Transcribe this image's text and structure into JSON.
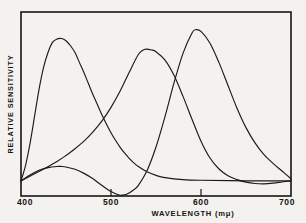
{
  "figure": {
    "background_color": "#f4f2ee",
    "ink_color": "#141414",
    "frame": {
      "left": 21,
      "top": 12,
      "right": 291,
      "bottom": 196
    }
  },
  "axis": {
    "x_title": "WAVELENGTH  (mμ)",
    "y_title": "RELATIVE  SENSITIVITY",
    "x_tick_labels": [
      "400",
      "500",
      "600",
      "700"
    ],
    "x_tick_values": [
      400,
      500,
      600,
      700
    ],
    "x_minor_ticks_drawn_at": [
      500,
      600
    ]
  },
  "chart_data": {
    "type": "line",
    "title": "",
    "subtitle": "",
    "xlabel": "WAVELENGTH  (mμ)",
    "ylabel": "RELATIVE  SENSITIVITY",
    "xlim": [
      400,
      700
    ],
    "ylim": [
      -0.09,
      1.0
    ],
    "grid": false,
    "legend": "none",
    "x_tick_labels": [
      "400",
      "500",
      "600",
      "700"
    ],
    "y_tick_labels": [],
    "annotations": [],
    "series": [
      {
        "name": "blue-receptor",
        "peak_wavelength": 445,
        "peak_value": 0.84,
        "x": [
          400,
          405,
          410,
          415,
          420,
          425,
          430,
          435,
          440,
          445,
          450,
          455,
          460,
          465,
          470,
          475,
          480,
          485,
          490,
          495,
          500,
          505,
          510,
          515,
          520,
          525,
          530,
          540,
          550,
          560,
          580,
          600,
          650,
          700
        ],
        "values": [
          0.0,
          0.09,
          0.22,
          0.38,
          0.54,
          0.67,
          0.76,
          0.82,
          0.84,
          0.843,
          0.83,
          0.8,
          0.76,
          0.7,
          0.64,
          0.575,
          0.51,
          0.45,
          0.39,
          0.335,
          0.285,
          0.24,
          0.2,
          0.165,
          0.135,
          0.108,
          0.086,
          0.053,
          0.032,
          0.019,
          0.007,
          0.003,
          0.0,
          0.0
        ]
      },
      {
        "name": "green-receptor",
        "peak_wavelength": 539,
        "peak_value": 0.78,
        "x": [
          400,
          420,
          440,
          450,
          460,
          470,
          480,
          490,
          500,
          510,
          520,
          530,
          535,
          539,
          545,
          550,
          560,
          570,
          580,
          590,
          600,
          610,
          620,
          630,
          640,
          650,
          660,
          670,
          680,
          690,
          700
        ],
        "values": [
          0.0,
          0.055,
          0.115,
          0.15,
          0.19,
          0.235,
          0.29,
          0.355,
          0.435,
          0.53,
          0.64,
          0.745,
          0.772,
          0.78,
          0.775,
          0.765,
          0.715,
          0.625,
          0.5,
          0.365,
          0.235,
          0.135,
          0.07,
          0.03,
          0.007,
          -0.008,
          -0.016,
          -0.018,
          -0.014,
          -0.007,
          0.0
        ]
      },
      {
        "name": "red-receptor",
        "peak_wavelength": 594,
        "peak_value": 0.895,
        "secondary_lobe_wavelength": 445,
        "secondary_lobe_value": 0.085,
        "minimum_wavelength": 512,
        "minimum_value": -0.085,
        "x": [
          400,
          410,
          420,
          430,
          440,
          445,
          450,
          460,
          470,
          480,
          490,
          500,
          508,
          512,
          518,
          525,
          530,
          540,
          550,
          560,
          570,
          580,
          590,
          594,
          600,
          610,
          620,
          630,
          640,
          650,
          660,
          670,
          680,
          690,
          700
        ],
        "values": [
          0.0,
          0.035,
          0.062,
          0.078,
          0.085,
          0.085,
          0.082,
          0.068,
          0.044,
          0.012,
          -0.028,
          -0.064,
          -0.083,
          -0.085,
          -0.078,
          -0.054,
          -0.03,
          0.06,
          0.2,
          0.38,
          0.58,
          0.755,
          0.875,
          0.895,
          0.885,
          0.815,
          0.7,
          0.565,
          0.43,
          0.315,
          0.225,
          0.155,
          0.103,
          0.058,
          0.012
        ]
      }
    ]
  }
}
